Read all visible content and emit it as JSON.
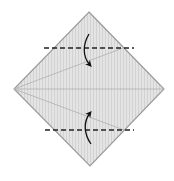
{
  "diagram": {
    "type": "origami-fold-instruction",
    "colors": {
      "paper_fill": "#e4e4e4",
      "paper_stripe": "#d2d2d2",
      "outline": "#9a9a9a",
      "crease": "#b4b4b4",
      "valley_fold_line": "#222222",
      "arrow": "#111111"
    },
    "paper": {
      "shape": "diamond",
      "vertices": [
        [
          89,
          12
        ],
        [
          164,
          89
        ],
        [
          90,
          166
        ],
        [
          14,
          89
        ]
      ]
    },
    "creases": [
      {
        "name": "center-crease",
        "from": [
          14,
          89
        ],
        "to": [
          164,
          89
        ]
      },
      {
        "name": "upper-kite-crease",
        "from": [
          14,
          89
        ],
        "to": [
          123,
          48
        ]
      },
      {
        "name": "lower-kite-crease",
        "from": [
          14,
          89
        ],
        "to": [
          124,
          130
        ]
      }
    ],
    "fold_lines": [
      {
        "name": "upper-valley-fold",
        "y": 48,
        "x1": 44,
        "x2": 134
      },
      {
        "name": "lower-valley-fold",
        "y": 130,
        "x1": 45,
        "x2": 134
      }
    ],
    "arrows": [
      {
        "name": "fold-down-arrow",
        "direction": "down"
      },
      {
        "name": "fold-up-arrow",
        "direction": "up"
      }
    ]
  }
}
